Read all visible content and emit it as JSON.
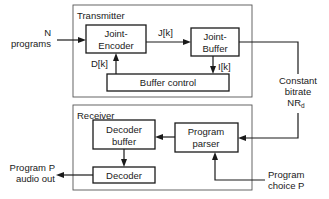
{
  "diagram": {
    "transmitter": {
      "title": "Transmitter",
      "joint_encoder": {
        "line1": "Joint-",
        "line2": "Encoder"
      },
      "joint_buffer": {
        "line1": "Joint-",
        "line2": "Buffer"
      },
      "buffer_control": "Buffer control",
      "signals": {
        "j": "J[k]",
        "d": "D[k]",
        "i": "I[k]"
      }
    },
    "receiver": {
      "title": "Receiver",
      "decoder_buffer": {
        "line1": "Decoder",
        "line2": "buffer"
      },
      "decoder": "Decoder",
      "program_parser": {
        "line1": "Program",
        "line2": "parser"
      }
    },
    "inputs": {
      "n_programs": {
        "line1": "N",
        "line2": "programs"
      },
      "program_choice": {
        "line1": "Program",
        "line2": "choice P"
      }
    },
    "outputs": {
      "audio_out": {
        "line1": "Program P",
        "line2": "audio out"
      }
    },
    "channel": {
      "line1": "Constant",
      "line2": "bitrate",
      "line3": "NR",
      "line3_sub": "d"
    },
    "colors": {
      "line": "#1a1a1a",
      "panel_border": "#555555",
      "background": "#ffffff"
    }
  }
}
